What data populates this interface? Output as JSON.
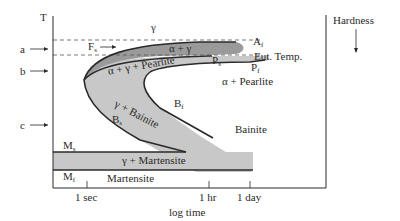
{
  "diagram": {
    "y_axis_label": "T",
    "x_axis_label": "log time",
    "x_ticks": [
      "1 sec",
      "1 hr",
      "1 day"
    ],
    "side_indicator": "Hardness",
    "temperature_markers": [
      "a",
      "b",
      "c"
    ],
    "lines": {
      "austenite_finish": "A",
      "austenite_finish_sub": "f",
      "eutectoid": "Eut. Temp.",
      "ferrite_start": "F",
      "ferrite_start_sub": "s",
      "pearlite_start": "P",
      "pearlite_start_sub": "s",
      "pearlite_finish": "P",
      "pearlite_finish_sub": "f",
      "bainite_start": "B",
      "bainite_start_sub": "s",
      "bainite_finish": "B",
      "bainite_finish_sub": "f",
      "martensite_start": "M",
      "martensite_start_sub": "s",
      "martensite_finish": "M",
      "martensite_finish_sub": "f"
    },
    "regions": {
      "gamma": "γ",
      "alpha_gamma": "α + γ",
      "alpha_gamma_pearlite": "α + γ + Pearlite",
      "alpha_pearlite": "α + Pearlite",
      "gamma_bainite": "γ + Bainite",
      "bainite": "Bainite",
      "gamma_martensite": "γ + Martensite",
      "martensite": "Martensite"
    },
    "colors": {
      "dark_band": "#9a9a9a",
      "light_band": "#c8c8c8",
      "line": "#2a2a2a",
      "background": "#ffffff"
    }
  }
}
